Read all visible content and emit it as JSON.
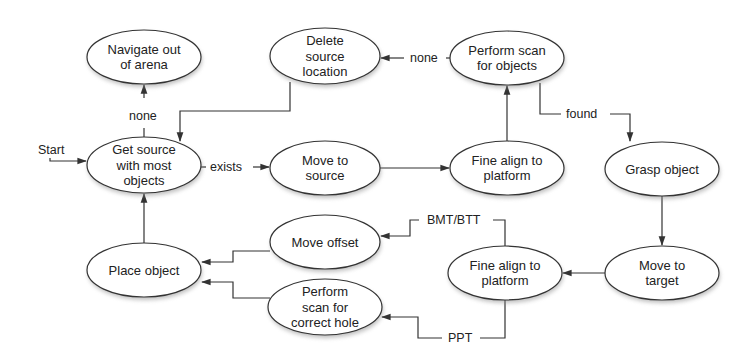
{
  "diagram": {
    "type": "state-machine",
    "start_label": "Start",
    "nodes": [
      {
        "id": "navigate",
        "lines": [
          "Navigate out",
          "of arena"
        ],
        "cx": 144,
        "cy": 57,
        "rx": 57,
        "ry": 27
      },
      {
        "id": "get_source",
        "lines": [
          "Get source",
          "with most",
          "objects"
        ],
        "cx": 144,
        "cy": 165,
        "rx": 57,
        "ry": 28
      },
      {
        "id": "delete_source",
        "lines": [
          "Delete",
          "source",
          "location"
        ],
        "cx": 325,
        "cy": 56,
        "rx": 55,
        "ry": 28
      },
      {
        "id": "scan_objects",
        "lines": [
          "Perform scan",
          "for objects"
        ],
        "cx": 507,
        "cy": 58,
        "rx": 57,
        "ry": 27
      },
      {
        "id": "move_source",
        "lines": [
          "Move to",
          "source"
        ],
        "cx": 325,
        "cy": 168,
        "rx": 55,
        "ry": 27
      },
      {
        "id": "fine_align_1",
        "lines": [
          "Fine align to",
          "platform"
        ],
        "cx": 507,
        "cy": 168,
        "rx": 57,
        "ry": 27
      },
      {
        "id": "grasp",
        "lines": [
          "Grasp object"
        ],
        "cx": 662,
        "cy": 169,
        "rx": 57,
        "ry": 27
      },
      {
        "id": "place",
        "lines": [
          "Place object"
        ],
        "cx": 144,
        "cy": 270,
        "rx": 57,
        "ry": 27
      },
      {
        "id": "move_offset",
        "lines": [
          "Move offset"
        ],
        "cx": 325,
        "cy": 242,
        "rx": 55,
        "ry": 27
      },
      {
        "id": "scan_hole",
        "lines": [
          "Perform",
          "scan for",
          "correct hole"
        ],
        "cx": 325,
        "cy": 307,
        "rx": 57,
        "ry": 28
      },
      {
        "id": "fine_align_2",
        "lines": [
          "Fine align to",
          "platform"
        ],
        "cx": 505,
        "cy": 273,
        "rx": 57,
        "ry": 27
      },
      {
        "id": "move_target",
        "lines": [
          "Move to",
          "target"
        ],
        "cx": 662,
        "cy": 273,
        "rx": 57,
        "ry": 27
      }
    ],
    "edges": [
      {
        "from": "start",
        "to": "get_source",
        "label": ""
      },
      {
        "from": "get_source",
        "to": "navigate",
        "label": "none"
      },
      {
        "from": "get_source",
        "to": "move_source",
        "label": "exists"
      },
      {
        "from": "delete_source",
        "to": "get_source",
        "label": ""
      },
      {
        "from": "move_source",
        "to": "fine_align_1",
        "label": ""
      },
      {
        "from": "fine_align_1",
        "to": "scan_objects",
        "label": ""
      },
      {
        "from": "scan_objects",
        "to": "delete_source",
        "label": "none"
      },
      {
        "from": "scan_objects",
        "to": "grasp",
        "label": "found"
      },
      {
        "from": "grasp",
        "to": "move_target",
        "label": ""
      },
      {
        "from": "move_target",
        "to": "fine_align_2",
        "label": ""
      },
      {
        "from": "fine_align_2",
        "to": "move_offset",
        "label": "BMT/BTT"
      },
      {
        "from": "fine_align_2",
        "to": "scan_hole",
        "label": "PPT"
      },
      {
        "from": "move_offset",
        "to": "place",
        "label": ""
      },
      {
        "from": "scan_hole",
        "to": "place",
        "label": ""
      },
      {
        "from": "place",
        "to": "get_source",
        "label": ""
      }
    ],
    "labels": {
      "start": "Start",
      "none_top": "none",
      "none_scan": "none",
      "exists": "exists",
      "found": "found",
      "bmt_btt": "BMT/BTT",
      "ppt": "PPT"
    },
    "colors": {
      "stroke": "#333333",
      "fill": "#ffffff",
      "text": "#222222",
      "shadow": "#8a8a8a"
    }
  }
}
